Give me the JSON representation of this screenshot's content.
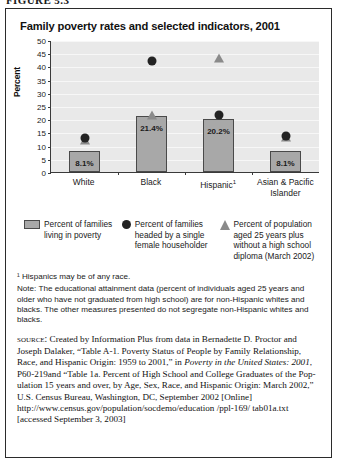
{
  "figure": {
    "number_label": "FIGURE 5.3"
  },
  "chart": {
    "title": "Family poverty rates and selected indicators, 2001"
  },
  "chart_data": {
    "type": "bar",
    "title": "Family poverty rates and selected indicators, 2001",
    "xlabel": "",
    "ylabel": "Percent",
    "ylim": [
      0,
      50
    ],
    "yticks": [
      0,
      5,
      10,
      15,
      20,
      25,
      30,
      35,
      40,
      45,
      50
    ],
    "ytick_labels": [
      "0",
      "5",
      "10",
      "15",
      "20",
      "25",
      "30",
      "35",
      "40",
      "45",
      "50"
    ],
    "grid": true,
    "legend_position": "below",
    "categories": [
      "White",
      "Black",
      "Hispanic¹",
      "Asian & Pacific Islander"
    ],
    "category_labels": [
      "White",
      "Black",
      "Hispanic",
      "Asian & Pacific\nIslander"
    ],
    "series": [
      {
        "name": "Percent of families living in poverty",
        "marker": "bar",
        "color": "#a8a8a8",
        "values": [
          8.1,
          21.4,
          20.2,
          8.1
        ],
        "data_labels": [
          "8.1%",
          "21.4%",
          "20.2%",
          "8.1%"
        ]
      },
      {
        "name": "Percent of families headed by a single female householder",
        "marker": "circle",
        "color": "#232323",
        "values": [
          12.8,
          42.0,
          21.5,
          13.5
        ],
        "data_labels": [
          "",
          "",
          "",
          ""
        ]
      },
      {
        "name": "Percent of population aged 25 years plus without a high school diploma (March 2002)",
        "marker": "triangle",
        "color": "#8a8a8a",
        "values": [
          12.0,
          21.6,
          43.0,
          13.3
        ],
        "data_labels": [
          "",
          "",
          "",
          ""
        ]
      }
    ]
  },
  "legend": [
    {
      "swatch": "rect-swatch-icon",
      "text": "Percent of families living in poverty"
    },
    {
      "swatch": "circle-swatch-icon",
      "text": "Percent of families headed by a single female householder"
    },
    {
      "swatch": "triangle-swatch-icon",
      "text": "Percent of population aged 25 years plus without a high school diploma (March 2002)"
    }
  ],
  "notes": {
    "footnote": "¹ Hispanics may be of any race.",
    "note": "Note: The educational attainment data (percent of individuals aged 25 years and older who have not graduated from high school) are for non-Hispanic whites and blacks. The other measures presented do not segregate non-Hispanic whites and blacks."
  },
  "source": {
    "label": "source:",
    "part1": " Created by Information Plus from data in Bernadette D. Proctor and Joseph Dalaker, “Table A-1. Poverty Status of People by Family Relationship, Race, and Hispanic Origin: 1959 to 2001,” in ",
    "italic1": "Poverty in the United States: 2001",
    "part2": ", P60-219and “Table 1a. Percent of High School and College Graduates of the Pop-ulation 15 years and over, by Age, Sex, Race, and Hispanic Origin: March 2002,” U.S. Census Bureau, Washington, DC, September 2002 [Online] http://www.census.gov/population/socdemo/education /ppl-169/ tab01a.txt [accessed September 3, 2003]"
  }
}
